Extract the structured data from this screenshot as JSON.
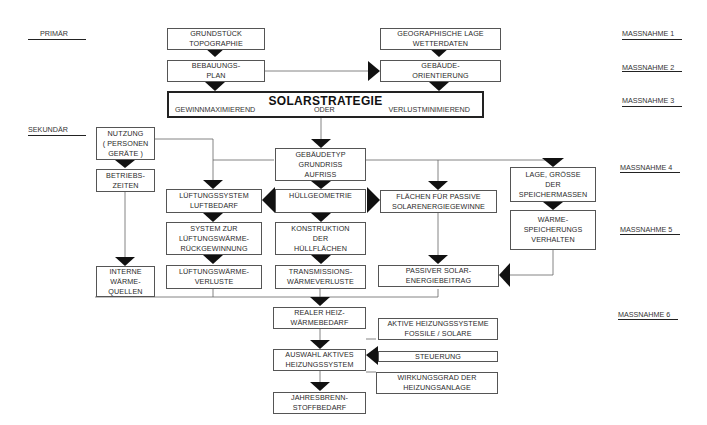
{
  "levels": {
    "primar": "PRIMÄR",
    "sekundar": "SEKUNDÄR"
  },
  "massnahmen": [
    "MASSNAHME 1",
    "MASSNAHME 2",
    "MASSNAHME 3",
    "MASSNAHME 4",
    "MASSNAHME 5",
    "MASSNAHME 6"
  ],
  "solarstrategie": {
    "title": "SOLARSTRATEGIE",
    "left": "GEWINNMAXIMIEREND",
    "middle": "ODER",
    "right": "VERLUSTMINIMIEREND"
  },
  "boxes": {
    "grundstueck": [
      "GRUNDSTÜCK",
      "TOPOGRAPHIE"
    ],
    "bebauungsplan": [
      "BEBAUUNGS-",
      "PLAN"
    ],
    "geolage": [
      "GEOGRAPHISCHE LAGE",
      "WETTERDATEN"
    ],
    "orientierung": [
      "GEBÄUDE-",
      "ORIENTIERUNG"
    ],
    "nutzung": [
      "NUTZUNG",
      "( PERSONEN",
      "GERÄTE )"
    ],
    "betriebszeiten": [
      "BETRIEBS-",
      "ZEITEN"
    ],
    "gebaeudetyp": [
      "GEBÄUDETYP",
      "GRUNDRISS",
      "AUFRISS"
    ],
    "lueftungssystem": [
      "LÜFTUNGSSYSTEM",
      "LUFTBEDARF"
    ],
    "huellgeometrie": [
      "HÜLLGEOMETRIE"
    ],
    "flaechen": [
      "FLÄCHEN FÜR PASSIVE",
      "SOLARENERGIEGEWINNE"
    ],
    "speichermassen": [
      "LAGE, GRÖSSE",
      "DER",
      "SPEICHERMASSEN"
    ],
    "waermerueck": [
      "SYSTEM ZUR",
      "LÜFTUNGSWÄRME-",
      "RÜCKGEWINNUNG"
    ],
    "konstruktion": [
      "KONSTRUKTION",
      "DER",
      "HÜLLFLÄCHEN"
    ],
    "speicherverhalten": [
      "WÄRME-",
      "SPEICHERUNGS",
      "VERHALTEN"
    ],
    "interne": [
      "INTERNE",
      "WÄRME-",
      "QUELLEN"
    ],
    "lueftungsverluste": [
      "LÜFTUNGSWÄRME-",
      "VERLUSTE"
    ],
    "transmission": [
      "TRANSMISSIONS-",
      "WÄRMEVERLUSTE"
    ],
    "passiversolar": [
      "PASSIVER SOLAR-",
      "ENERGIEBEITRAG"
    ],
    "realer": [
      "REALER HEIZ-",
      "WÄRMEBEDARF"
    ],
    "aktive": [
      "AKTIVE HEIZUNGSSYSTEME",
      "FOSSILE / SOLARE"
    ],
    "auswahl": [
      "AUSWAHL AKTIVES",
      "HEIZUNGSSYSTEM"
    ],
    "steuerung": [
      "STEUERUNG"
    ],
    "wirkungsgrad": [
      "WIRKUNGSGRAD DER",
      "HEIZUNGSANLAGE"
    ],
    "jahres": [
      "JAHRESBRENN-",
      "STOFFBEDARF"
    ]
  },
  "colors": {
    "line": "#555555",
    "arrow": "#111111",
    "text": "#2a2a2a"
  }
}
